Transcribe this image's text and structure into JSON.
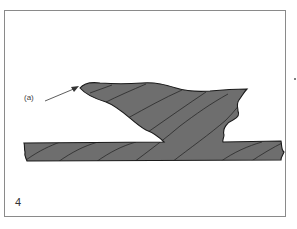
{
  "figure": {
    "number": "4",
    "callout_label": "(a)",
    "callout_target": "tip of weld overlap",
    "colors": {
      "fill": "#6e6e6e",
      "outline": "#1a1a1a",
      "hatch": "#2a2a2a",
      "frame": "#8a8a8a"
    }
  }
}
